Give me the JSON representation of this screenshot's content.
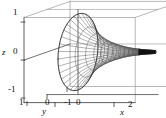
{
  "figure": {
    "kind": "3d-wireframe-surface-plot",
    "background": "#ffffff",
    "line_color": "#333333",
    "mesh_color": "#555555",
    "box_color": "#999999"
  },
  "chart_data": {
    "type": "line",
    "title": "",
    "subtitle": "",
    "xlabel": "x",
    "ylabel": "y",
    "zlabel": "z",
    "grid": false,
    "legend": "none",
    "projection": "3d",
    "surface": "horn / trumpet (tractricoid-like) surface of revolution about the x-axis, flared at x=0 and tapering to a thin tip near x=2.6",
    "mesh": {
      "u_lines": 16,
      "v_lines": 15
    },
    "xlim": [
      -1.0,
      2.8
    ],
    "ylim": [
      -1.2,
      1.2
    ],
    "zlim": [
      -1.2,
      1.2
    ],
    "xticks": [
      0,
      2
    ],
    "xticklabels": [
      "0",
      "2"
    ],
    "yticks": [
      1,
      0,
      -1
    ],
    "yticklabels": [
      "1",
      "0",
      "-1"
    ],
    "zticks": [
      1,
      0,
      -1
    ],
    "zticklabels": [
      "1",
      "0",
      "-1"
    ],
    "radius_profile": {
      "x": [
        0.0,
        0.2,
        0.4,
        0.6,
        0.8,
        1.0,
        1.2,
        1.4,
        1.6,
        1.8,
        2.0,
        2.2,
        2.4,
        2.6
      ],
      "r": [
        1.0,
        0.78,
        0.6,
        0.46,
        0.36,
        0.28,
        0.22,
        0.17,
        0.13,
        0.1,
        0.08,
        0.06,
        0.05,
        0.04
      ]
    }
  },
  "axes": {
    "z": {
      "label": "z",
      "ticks": [
        "1",
        "0",
        "-1"
      ]
    },
    "y": {
      "label": "y",
      "ticks": [
        "1",
        "0",
        "-1"
      ]
    },
    "x": {
      "label": "x",
      "ticks": [
        "0",
        "2"
      ]
    }
  }
}
